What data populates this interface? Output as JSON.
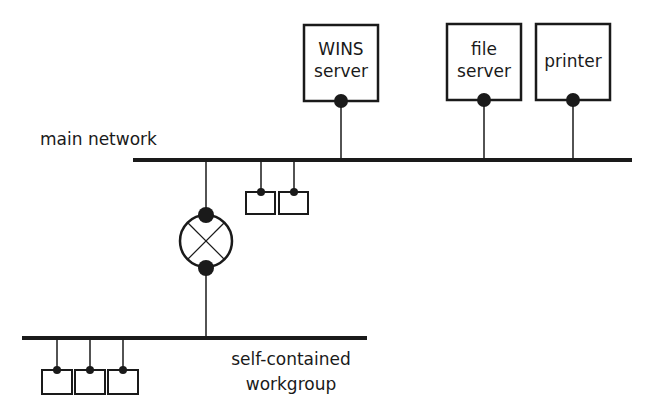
{
  "diagram": {
    "type": "network topology",
    "networks": {
      "main": {
        "label": "main network"
      },
      "workgroup": {
        "label_line1": "self-contained",
        "label_line2": "workgroup"
      }
    },
    "servers": [
      {
        "id": "wins",
        "line1": "WINS",
        "line2": "server"
      },
      {
        "id": "file",
        "line1": "file",
        "line2": "server"
      },
      {
        "id": "printer",
        "line1": "printer",
        "line2": ""
      }
    ],
    "devices": {
      "main_clients": 2,
      "workgroup_clients": 3,
      "router": "router connecting main network and workgroup"
    },
    "colors": {
      "line": "#1a1a1a",
      "background": "#ffffff"
    }
  }
}
